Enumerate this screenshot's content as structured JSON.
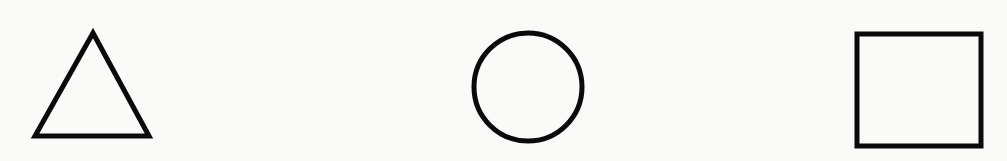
{
  "diagram": {
    "background": "#fafaf9",
    "stroke_color": "#0a0a0a",
    "shapes": [
      {
        "name": "triangle",
        "type": "polygon",
        "points": "93,33 35,136 149,136",
        "stroke_width": 5
      },
      {
        "name": "circle",
        "type": "circle",
        "cx": 528,
        "cy": 87,
        "r": 54,
        "stroke_width": 5
      },
      {
        "name": "square",
        "type": "rect",
        "x": 857,
        "y": 34,
        "width": 124,
        "height": 112,
        "stroke_width": 5
      }
    ]
  }
}
